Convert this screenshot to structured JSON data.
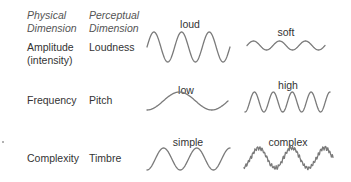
{
  "headers": {
    "physical": [
      "Physical",
      "Dimension"
    ],
    "perceptual": [
      "Perceptual",
      "Dimension"
    ]
  },
  "rows": [
    {
      "physical": [
        "Amplitude",
        "(intensity)"
      ],
      "perceptual": "Loudness",
      "left_label": "loud",
      "right_label": "soft"
    },
    {
      "physical": [
        "Frequency"
      ],
      "perceptual": "Pitch",
      "left_label": "low",
      "right_label": "high"
    },
    {
      "physical": [
        "Complexity"
      ],
      "perceptual": "Timbre",
      "left_label": "simple",
      "right_label": "complex"
    }
  ],
  "waves": {
    "loud": {
      "x0": 147,
      "x1": 230,
      "yc": 47,
      "amp": 15,
      "cycles": 3,
      "phase": 0.75,
      "noise": 0
    },
    "soft": {
      "x0": 247,
      "x1": 325,
      "yc": 45.5,
      "amp": 4.5,
      "cycles": 3,
      "phase": 0.75,
      "noise": 0
    },
    "low": {
      "x0": 147,
      "x1": 228,
      "yc": 101,
      "amp": 9,
      "cycles": 1.25,
      "phase": 0.5,
      "noise": 0
    },
    "high": {
      "x0": 245,
      "x1": 330,
      "yc": 102,
      "amp": 10,
      "cycles": 4.5,
      "phase": 0.5,
      "noise": 0
    },
    "simple": {
      "x0": 147,
      "x1": 230,
      "yc": 159,
      "amp": 11,
      "cycles": 2.5,
      "phase": 0.5,
      "noise": 0
    },
    "complex": {
      "x0": 244,
      "x1": 333,
      "yc": 158,
      "amp": 10,
      "cycles": 2.7,
      "phase": 0.55,
      "noise": 2.2
    }
  }
}
